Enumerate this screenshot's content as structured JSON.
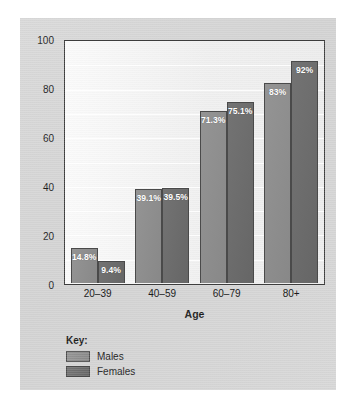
{
  "chart_data": {
    "type": "bar",
    "title": "",
    "xlabel": "Age",
    "ylabel": "Percent of population with CVD",
    "categories": [
      "20–39",
      "40–59",
      "60–79",
      "80+"
    ],
    "series": [
      {
        "name": "Males",
        "color": "#8d8d8d",
        "values": [
          14.8,
          39.1,
          71.3,
          83
        ],
        "labels": [
          "14.8%",
          "39.1%",
          "71.3%",
          "83%"
        ]
      },
      {
        "name": "Females",
        "color": "#6c6c6c",
        "values": [
          9.4,
          39.5,
          75.1,
          92
        ],
        "labels": [
          "9.4%",
          "39.5%",
          "75.1%",
          "92%"
        ]
      }
    ],
    "ylim": [
      0,
      100
    ],
    "yticks": [
      0,
      20,
      40,
      60,
      80,
      100
    ],
    "ytick_labels": [
      "0",
      "20",
      "40",
      "60",
      "80",
      "100"
    ],
    "gridlines": {
      "visible": true,
      "interval": 10,
      "color": "#ffffff"
    },
    "legend": {
      "position": "below-left",
      "title": "Key:",
      "entries": [
        "Males",
        "Females"
      ]
    }
  },
  "colors": {
    "card_background": "#d6d6d6",
    "plot_background": "#f2f2f2",
    "axis": "#3d3d3d",
    "males": "#8d8d8d",
    "females": "#6c6c6c",
    "label_text": "#ffffff",
    "text": "#1c1c1c"
  }
}
